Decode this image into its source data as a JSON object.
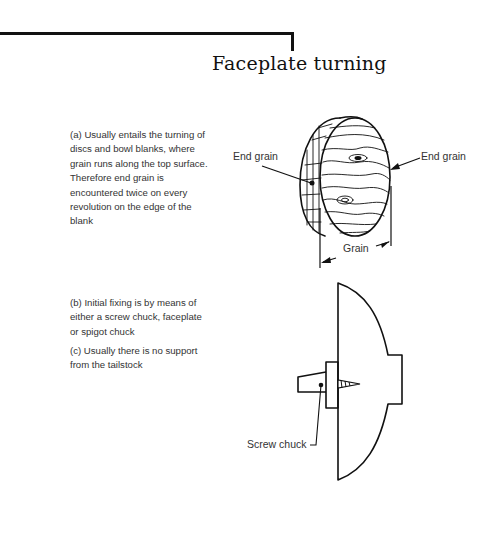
{
  "page": {
    "title": "Faceplate turning"
  },
  "text_blocks": [
    {
      "id": "a",
      "text": "(a) Usually entails the turning of discs and bowl blanks, where grain runs along the top surface. Therefore end grain is encountered twice on every revolution on the edge of the blank"
    },
    {
      "id": "b",
      "text": "(b) Initial fixing is by means of either a screw chuck, faceplate or spigot chuck"
    },
    {
      "id": "c",
      "text": "(c) Usually there is no support from the tailstock"
    }
  ],
  "figure_disc": {
    "labels": {
      "end_grain_left": "End grain",
      "end_grain_right": "End grain",
      "grain": "Grain"
    }
  },
  "figure_chuck": {
    "labels": {
      "screw_chuck": "Screw chuck"
    }
  },
  "colors": {
    "ink": "#111111",
    "body_text": "#333333",
    "background": "#ffffff"
  }
}
